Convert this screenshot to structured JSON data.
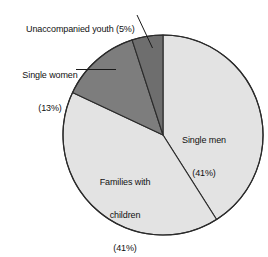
{
  "chart_data": {
    "type": "pie",
    "title": "",
    "subtitle": "",
    "xlabel": "",
    "ylabel": "",
    "legend_position": "none",
    "grid": false,
    "units": "percent",
    "categories": [
      "Single men",
      "Families with children",
      "Single women",
      "Unaccompanied youth"
    ],
    "values": [
      41,
      41,
      13,
      5
    ],
    "slices": [
      {
        "name": "Single men",
        "value": 41,
        "percent_text": "(41%)",
        "label_lines": [
          "Single men",
          "(41%)"
        ],
        "color": "#e3e3e3",
        "label_placement": "inside",
        "start_angle_deg": 0,
        "end_angle_deg": 147.6
      },
      {
        "name": "Families with children",
        "value": 41,
        "percent_text": "(41%)",
        "label_lines": [
          "Families with",
          "children",
          "(41%)"
        ],
        "color": "#e3e3e3",
        "label_placement": "inside",
        "start_angle_deg": 147.6,
        "end_angle_deg": 295.2
      },
      {
        "name": "Single women",
        "value": 13,
        "percent_text": "(13%)",
        "label_lines": [
          "Single women",
          "(13%)"
        ],
        "color": "#7d7d7d",
        "label_placement": "outside-left",
        "start_angle_deg": 295.2,
        "end_angle_deg": 342.0
      },
      {
        "name": "Unaccompanied youth",
        "value": 5,
        "percent_text": "(5%)",
        "label_lines": [
          "Unaccompanied youth (5%)"
        ],
        "color": "#6e6e6e",
        "label_placement": "outside-top",
        "start_angle_deg": 342.0,
        "end_angle_deg": 360.0
      }
    ],
    "total": 100,
    "stroke_color": "#2b2b2b",
    "background": "#ffffff"
  },
  "labels": {
    "youth": "Unaccompanied youth (5%)",
    "women_line1": "Single women",
    "women_line2": "(13%)",
    "men_line1": "Single men",
    "men_line2": "(41%)",
    "families_line1": "Families with",
    "families_line2": "children",
    "families_line3": "(41%)"
  }
}
